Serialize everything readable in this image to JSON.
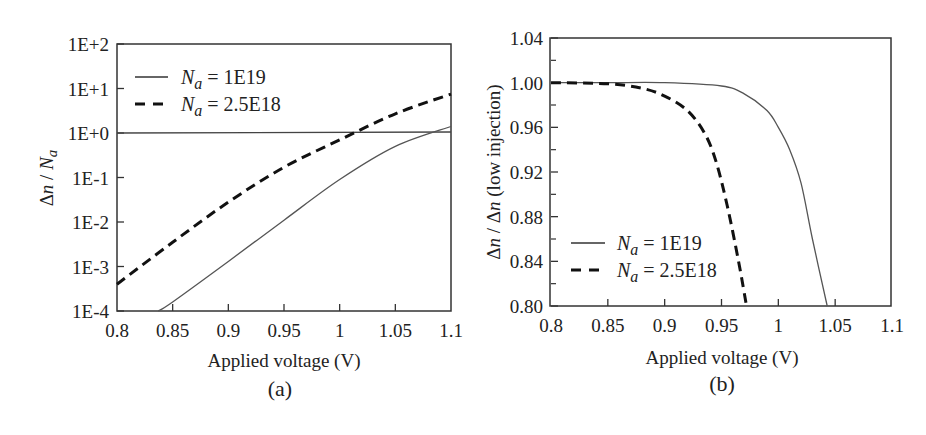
{
  "chart_data": [
    {
      "id": "a",
      "type": "line",
      "panel_label": "(a)",
      "title": "",
      "xlabel": "Applied voltage (V)",
      "ylabel": "Δn / Na",
      "yscale": "log",
      "xlim": [
        0.8,
        1.1
      ],
      "ylim": [
        0.0001,
        100
      ],
      "xticks": [
        "0.8",
        "0.85",
        "0.9",
        "0.95",
        "1",
        "1.05",
        "1.1"
      ],
      "yticks": [
        "1E-4",
        "1E-3",
        "1E-2",
        "1E-1",
        "1E+0",
        "1E+1",
        "1E+2"
      ],
      "grid": false,
      "legend_position": "upper left",
      "reference_line": {
        "y": 1,
        "style": "solid"
      },
      "series": [
        {
          "name": "Na = 1E19",
          "style": "solid",
          "x": [
            0.837,
            0.85,
            0.9,
            0.95,
            1.0,
            1.05,
            1.1
          ],
          "y": [
            0.0001,
            0.00016,
            0.0013,
            0.011,
            0.09,
            0.5,
            1.4
          ]
        },
        {
          "name": "Na = 2.5E18",
          "style": "dashed",
          "x": [
            0.8,
            0.85,
            0.9,
            0.95,
            1.0,
            1.05,
            1.1
          ],
          "y": [
            0.0004,
            0.0035,
            0.028,
            0.17,
            0.7,
            2.7,
            7.5
          ]
        }
      ]
    },
    {
      "id": "b",
      "type": "line",
      "panel_label": "(b)",
      "title": "",
      "xlabel": "Applied voltage (V)",
      "ylabel": "Δn / Δn (low injection)",
      "xlim": [
        0.8,
        1.1
      ],
      "ylim": [
        0.8,
        1.04
      ],
      "xticks": [
        "0.8",
        "0.85",
        "0.9",
        "0.95",
        "1",
        "1.05",
        "1.1"
      ],
      "yticks": [
        "0.80",
        "0.84",
        "0.88",
        "0.92",
        "0.96",
        "1.00",
        "1.04"
      ],
      "grid": false,
      "legend_position": "lower left",
      "series": [
        {
          "name": "Na = 1E19",
          "style": "solid",
          "x": [
            0.8,
            0.85,
            0.9,
            0.95,
            0.97,
            0.99,
            1.0,
            1.01,
            1.02,
            1.03,
            1.043
          ],
          "y": [
            1.0,
            1.0,
            1.0,
            0.997,
            0.99,
            0.975,
            0.96,
            0.94,
            0.91,
            0.86,
            0.8
          ]
        },
        {
          "name": "Na = 2.5E18",
          "style": "dashed",
          "x": [
            0.8,
            0.85,
            0.88,
            0.9,
            0.92,
            0.935,
            0.945,
            0.955,
            0.965,
            0.972
          ],
          "y": [
            1.0,
            0.999,
            0.995,
            0.988,
            0.975,
            0.955,
            0.93,
            0.89,
            0.84,
            0.8
          ]
        }
      ]
    }
  ],
  "panels": {
    "a": {
      "panel_label": "(a)",
      "xlabel": "Applied voltage (V)",
      "ylabel_main": "Δ",
      "ylabel_n": "n",
      "ylabel_rest": " / ",
      "ylabel_na": "N",
      "ylabel_sub": "a",
      "legend": [
        {
          "sym": "N",
          "sub": "a",
          "text": " = 1E19"
        },
        {
          "sym": "N",
          "sub": "a",
          "text": " = 2.5E18"
        }
      ]
    },
    "b": {
      "panel_label": "(b)",
      "xlabel": "Applied voltage (V)",
      "ylabel_text": "(low injection)",
      "legend": [
        {
          "sym": "N",
          "sub": "a",
          "text": " = 1E19"
        },
        {
          "sym": "N",
          "sub": "a",
          "text": " = 2.5E18"
        }
      ]
    }
  }
}
